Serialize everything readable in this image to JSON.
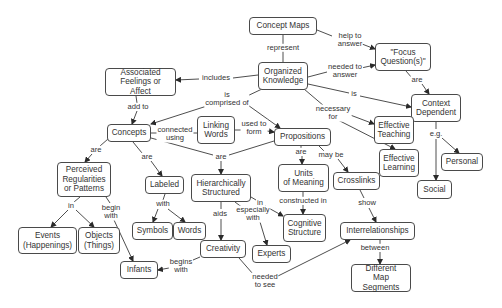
{
  "title": "Concept Maps",
  "colors": {
    "node_border": "#4a4a4a",
    "line": "#3a3a3a",
    "text": "#333333",
    "background": "#ffffff"
  },
  "nodes": [
    {
      "id": "concept_maps",
      "text": "Concept Maps",
      "x": 249,
      "y": 17,
      "w": 68,
      "h": 18
    },
    {
      "id": "organized_knowledge",
      "text": "Organized\nKnowledge",
      "x": 258,
      "y": 62,
      "w": 50,
      "h": 28
    },
    {
      "id": "focus_questions",
      "text": "\"Focus\nQuestion(s)\"",
      "x": 375,
      "y": 43,
      "w": 56,
      "h": 28
    },
    {
      "id": "associated_feelings",
      "text": "Associated\nFeelings or Affect",
      "x": 105,
      "y": 68,
      "w": 71,
      "h": 28
    },
    {
      "id": "context_dependent",
      "text": "Context\nDependent",
      "x": 411,
      "y": 94,
      "w": 50,
      "h": 28
    },
    {
      "id": "concepts",
      "text": "Concepts",
      "x": 107,
      "y": 124,
      "w": 44,
      "h": 18
    },
    {
      "id": "linking_words",
      "text": "Linking\nWords",
      "x": 197,
      "y": 116,
      "w": 38,
      "h": 28
    },
    {
      "id": "propositions",
      "text": "Propositions",
      "x": 274,
      "y": 128,
      "w": 57,
      "h": 18
    },
    {
      "id": "effective_teaching",
      "text": "Effective\nTeaching",
      "x": 374,
      "y": 116,
      "w": 40,
      "h": 28
    },
    {
      "id": "effective_learning",
      "text": "Effective\nLearning",
      "x": 379,
      "y": 149,
      "w": 40,
      "h": 28
    },
    {
      "id": "personal",
      "text": "Personal",
      "x": 441,
      "y": 153,
      "w": 42,
      "h": 18
    },
    {
      "id": "social",
      "text": "Social",
      "x": 417,
      "y": 180,
      "w": 35,
      "h": 19
    },
    {
      "id": "perceived_regularities",
      "text": "Perceived\nRegularities\nor Patterns",
      "x": 57,
      "y": 162,
      "w": 54,
      "h": 35
    },
    {
      "id": "labeled",
      "text": "Labeled",
      "x": 145,
      "y": 176,
      "w": 39,
      "h": 18
    },
    {
      "id": "hierarchically_structured",
      "text": "Hierarchically\nStructured",
      "x": 191,
      "y": 174,
      "w": 60,
      "h": 28
    },
    {
      "id": "units_of_meaning",
      "text": "Units\nof Meaning",
      "x": 278,
      "y": 164,
      "w": 51,
      "h": 28
    },
    {
      "id": "crosslinks",
      "text": "Crosslinks",
      "x": 333,
      "y": 172,
      "w": 47,
      "h": 18
    },
    {
      "id": "events",
      "text": "Events\n(Happenings)",
      "x": 18,
      "y": 227,
      "w": 59,
      "h": 27
    },
    {
      "id": "objects",
      "text": "Objects\n(Things)",
      "x": 78,
      "y": 227,
      "w": 42,
      "h": 27
    },
    {
      "id": "symbols",
      "text": "Symbols",
      "x": 132,
      "y": 222,
      "w": 41,
      "h": 18
    },
    {
      "id": "words",
      "text": "Words",
      "x": 173,
      "y": 222,
      "w": 33,
      "h": 18
    },
    {
      "id": "cognitive_structure",
      "text": "Cognitive\nStructure",
      "x": 283,
      "y": 214,
      "w": 43,
      "h": 28
    },
    {
      "id": "interrelationships",
      "text": "Interrelationships",
      "x": 340,
      "y": 222,
      "w": 75,
      "h": 18
    },
    {
      "id": "creativity",
      "text": "Creativity",
      "x": 200,
      "y": 240,
      "w": 46,
      "h": 18
    },
    {
      "id": "experts",
      "text": "Experts",
      "x": 252,
      "y": 245,
      "w": 39,
      "h": 18
    },
    {
      "id": "infants",
      "text": "Infants",
      "x": 120,
      "y": 261,
      "w": 38,
      "h": 18
    },
    {
      "id": "different_map_segments",
      "text": "Different\nMap Segments",
      "x": 351,
      "y": 264,
      "w": 60,
      "h": 28
    }
  ],
  "link_labels": [
    {
      "id": "represent",
      "text": "represent",
      "x": 283,
      "y": 48
    },
    {
      "id": "help_to_answer",
      "text": "help to\nanswer",
      "x": 350,
      "y": 40
    },
    {
      "id": "needed_to_answer",
      "text": "needed to\nanswer",
      "x": 345,
      "y": 71
    },
    {
      "id": "includes",
      "text": "includes",
      "x": 216,
      "y": 78
    },
    {
      "id": "is_comprised_of",
      "text": "is\ncomprised of",
      "x": 227,
      "y": 99
    },
    {
      "id": "is",
      "text": "is",
      "x": 354,
      "y": 94
    },
    {
      "id": "are_fq",
      "text": "are",
      "x": 417,
      "y": 80
    },
    {
      "id": "add_to",
      "text": "add to",
      "x": 138,
      "y": 107
    },
    {
      "id": "necessary_for",
      "text": "necessary\nfor",
      "x": 333,
      "y": 113
    },
    {
      "id": "connected_using",
      "text": "connected\nusing",
      "x": 175,
      "y": 134
    },
    {
      "id": "used_to_form",
      "text": "used to\nform",
      "x": 254,
      "y": 128
    },
    {
      "id": "eg",
      "text": "e.g.",
      "x": 436,
      "y": 134
    },
    {
      "id": "are_concepts_left",
      "text": "are",
      "x": 96,
      "y": 150
    },
    {
      "id": "are_labeled",
      "text": "are",
      "x": 147,
      "y": 157
    },
    {
      "id": "are_hier",
      "text": "are",
      "x": 221,
      "y": 157
    },
    {
      "id": "are_units",
      "text": "are",
      "x": 301,
      "y": 152
    },
    {
      "id": "may_be",
      "text": "may be",
      "x": 331,
      "y": 155
    },
    {
      "id": "in_events",
      "text": "in",
      "x": 71,
      "y": 206
    },
    {
      "id": "begin_with",
      "text": "begin\nwith",
      "x": 111,
      "y": 212
    },
    {
      "id": "with",
      "text": "with",
      "x": 163,
      "y": 204
    },
    {
      "id": "aids",
      "text": "aids",
      "x": 220,
      "y": 214
    },
    {
      "id": "especially_with",
      "text": "especially\nwith",
      "x": 253,
      "y": 214
    },
    {
      "id": "in_cog",
      "text": "in",
      "x": 260,
      "y": 203
    },
    {
      "id": "constructed_in",
      "text": "constructed in",
      "x": 303,
      "y": 201
    },
    {
      "id": "show",
      "text": "show",
      "x": 367,
      "y": 203
    },
    {
      "id": "between",
      "text": "between",
      "x": 375,
      "y": 248
    },
    {
      "id": "begins_with",
      "text": "begins\nwith",
      "x": 181,
      "y": 266
    },
    {
      "id": "needed_to_see",
      "text": "needed\nto see",
      "x": 265,
      "y": 281
    }
  ]
}
